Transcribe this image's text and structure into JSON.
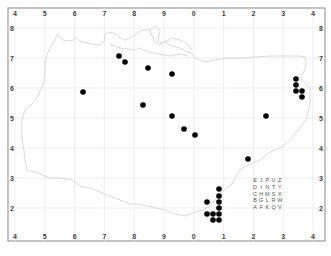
{
  "map": {
    "frame": {
      "x": 8,
      "y": 8,
      "width": 317,
      "height": 233
    },
    "x_grid": {
      "labels": [
        "4",
        "5",
        "6",
        "7",
        "8",
        "9",
        "0",
        "1",
        "2",
        "3",
        "4"
      ],
      "first_px": 15,
      "step_px": 29.8
    },
    "y_grid": {
      "labels": [
        "8",
        "7",
        "6",
        "5",
        "4",
        "3",
        "2"
      ],
      "first_px": 28,
      "step_px": 30
    },
    "colors": {
      "frame": "#888888",
      "grid": "#e6e6e6",
      "coast": "#cfcfcf",
      "dot": "#000000"
    },
    "tetrad_key": {
      "rows": [
        [
          "E",
          "J",
          "P",
          "U",
          "Z"
        ],
        [
          "D",
          "I",
          "N",
          "T",
          "Y"
        ],
        [
          "C",
          "H",
          "M",
          "S",
          "X"
        ],
        [
          "B",
          "G",
          "L",
          "R",
          "W"
        ],
        [
          "A",
          "F",
          "K",
          "Q",
          "V"
        ]
      ]
    },
    "records": [
      [
        119,
        56
      ],
      [
        125,
        62
      ],
      [
        148,
        68
      ],
      [
        172,
        74
      ],
      [
        83,
        92
      ],
      [
        143,
        105
      ],
      [
        172,
        116
      ],
      [
        184,
        129
      ],
      [
        195,
        135
      ],
      [
        266,
        116
      ],
      [
        248,
        159
      ],
      [
        219,
        189
      ],
      [
        219,
        196
      ],
      [
        219,
        202
      ],
      [
        219,
        208
      ],
      [
        219,
        214
      ],
      [
        219,
        220
      ],
      [
        207,
        202
      ],
      [
        207,
        214
      ],
      [
        213,
        214
      ],
      [
        213,
        220
      ],
      [
        296,
        79
      ],
      [
        296,
        85
      ],
      [
        296,
        91
      ],
      [
        302,
        91
      ],
      [
        302,
        97
      ]
    ]
  }
}
